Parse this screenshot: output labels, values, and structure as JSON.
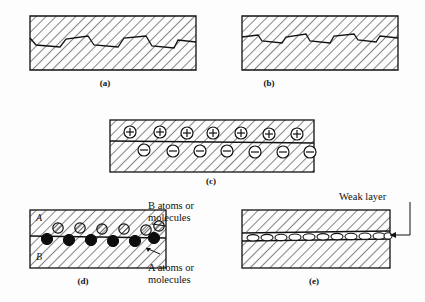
{
  "figure": {
    "background_color": "#fdfdfd",
    "line_color": "#111111",
    "hatch_color": "#222222"
  },
  "panels": [
    {
      "id": "a",
      "caption": "(a)",
      "description": "Rough interlocking interface with deep angular asperities between two hatched solids",
      "interface_type": "mechanical-interlocking-coarse",
      "asperity_count": 5
    },
    {
      "id": "b",
      "caption": "(b)",
      "description": "Shallow fine interlocking interface between two hatched solids",
      "interface_type": "mechanical-interlocking-fine",
      "asperity_count": 5
    },
    {
      "id": "c",
      "caption": "(c)",
      "description": "Electrostatic attraction across a planar interface with positive charges above and negative charges below",
      "interface_type": "electrostatic",
      "positive_charge_symbol": "+",
      "negative_charge_symbol": "−",
      "positive_charge_count": 7,
      "negative_charge_count": 7
    },
    {
      "id": "d",
      "caption": "(d)",
      "description": "Interdiffusion of A and B atoms or molecules across the interface",
      "interface_type": "diffusion",
      "upper_region_label": "A",
      "lower_region_label": "B",
      "b_particle_count": 6,
      "a_particle_count": 6
    },
    {
      "id": "e",
      "caption": "(e)",
      "description": "Weak boundary layer of elongated voids along the interface",
      "interface_type": "weak-boundary-layer",
      "void_count": 11
    }
  ],
  "annotations": {
    "b_atoms": {
      "line1": "B atoms or",
      "line2": "molecules"
    },
    "a_atoms": {
      "line1": "A atoms or",
      "line2": "molecules"
    },
    "weak_layer": {
      "text": "Weak layer"
    }
  }
}
